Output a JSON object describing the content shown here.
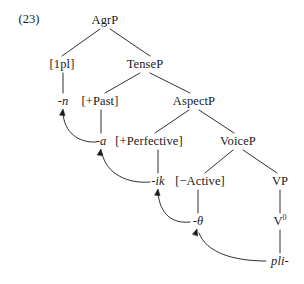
{
  "figure": {
    "example_number": "(23)",
    "type": "syntax-tree",
    "ink_color": "#1a1a1a",
    "background_color": "#ffffff"
  },
  "nodes": [
    {
      "id": "agrp",
      "label": "AgrP",
      "x": 105,
      "y": 20,
      "italic": false
    },
    {
      "id": "1pl",
      "label": "[1pl]",
      "x": 62,
      "y": 64,
      "italic": false
    },
    {
      "id": "tensep",
      "label": "TenseP",
      "x": 145,
      "y": 64,
      "italic": false
    },
    {
      "id": "n",
      "label": "-n",
      "x": 63,
      "y": 101,
      "italic": true
    },
    {
      "id": "past",
      "label": "[+Past]",
      "x": 100,
      "y": 101,
      "italic": false
    },
    {
      "id": "aspectp",
      "label": "AspectP",
      "x": 194,
      "y": 101,
      "italic": false
    },
    {
      "id": "a",
      "label": "-a",
      "x": 101,
      "y": 141,
      "italic": true
    },
    {
      "id": "perfective",
      "label": "[+Perfective]",
      "x": 149,
      "y": 141,
      "italic": false
    },
    {
      "id": "voicep",
      "label": "VoiceP",
      "x": 238,
      "y": 141,
      "italic": false
    },
    {
      "id": "ik",
      "label": "-ik",
      "x": 158,
      "y": 181,
      "italic": true
    },
    {
      "id": "active",
      "label": "[−Active]",
      "x": 200,
      "y": 181,
      "italic": false
    },
    {
      "id": "vp",
      "label": "VP",
      "x": 280,
      "y": 181,
      "italic": false
    },
    {
      "id": "theta",
      "label": "-θ",
      "x": 198,
      "y": 221,
      "italic": true
    },
    {
      "id": "pli",
      "label": "pli-",
      "x": 280,
      "y": 261,
      "italic": true
    }
  ],
  "v_zero": {
    "id": "v0",
    "base": "V",
    "superscript": "0",
    "x": 280,
    "y": 221
  },
  "branches": [
    {
      "from": "agrp",
      "to": "1pl",
      "x1": 100,
      "y1": 29,
      "x2": 62,
      "y2": 56
    },
    {
      "from": "agrp",
      "to": "tensep",
      "x1": 110,
      "y1": 29,
      "x2": 150,
      "y2": 56
    },
    {
      "from": "tensep",
      "to": "past",
      "x1": 140,
      "y1": 73,
      "x2": 105,
      "y2": 93
    },
    {
      "from": "tensep",
      "to": "aspectp",
      "x1": 150,
      "y1": 73,
      "x2": 190,
      "y2": 93
    },
    {
      "from": "aspectp",
      "to": "perfective",
      "x1": 189,
      "y1": 110,
      "x2": 155,
      "y2": 133
    },
    {
      "from": "aspectp",
      "to": "voicep",
      "x1": 199,
      "y1": 110,
      "x2": 234,
      "y2": 133
    },
    {
      "from": "voicep",
      "to": "active",
      "x1": 233,
      "y1": 150,
      "x2": 205,
      "y2": 173
    },
    {
      "from": "voicep",
      "to": "vp",
      "x1": 243,
      "y1": 150,
      "x2": 277,
      "y2": 173
    }
  ],
  "stems": [
    {
      "from": "1pl",
      "to": "n",
      "x": 63,
      "y1": 73,
      "y2": 93
    },
    {
      "from": "past",
      "to": "a",
      "x": 101,
      "y1": 110,
      "y2": 133
    },
    {
      "from": "perfective",
      "to": "ik",
      "x": 158,
      "y1": 150,
      "y2": 173
    },
    {
      "from": "active",
      "to": "theta",
      "x": 198,
      "y1": 190,
      "y2": 213
    },
    {
      "from": "vp",
      "to": "v0",
      "x": 280,
      "y1": 190,
      "y2": 213
    },
    {
      "from": "v0",
      "to": "pli",
      "x": 280,
      "y1": 230,
      "y2": 253
    }
  ],
  "movement_arrows": [
    {
      "id": "a-to-n",
      "from": "a",
      "to": "n",
      "path": "M 96 142 C 78 143, 64 132, 63 113",
      "head_x": 63,
      "head_y": 109,
      "head_angle": -84
    },
    {
      "id": "ik-to-a",
      "from": "ik",
      "to": "a",
      "path": "M 150 182 C 128 184, 106 174, 102 153",
      "head_x": 101,
      "head_y": 149,
      "head_angle": -80
    },
    {
      "id": "theta-to-ik",
      "from": "theta",
      "to": "ik",
      "path": "M 190 222 C 172 224, 160 214, 158 193",
      "head_x": 158,
      "head_y": 189,
      "head_angle": -84
    },
    {
      "id": "pli-to-theta",
      "from": "pli",
      "to": "theta",
      "path": "M 266 261 C 232 261, 206 252, 199 233",
      "head_x": 197,
      "head_y": 229,
      "head_angle": -72
    }
  ]
}
